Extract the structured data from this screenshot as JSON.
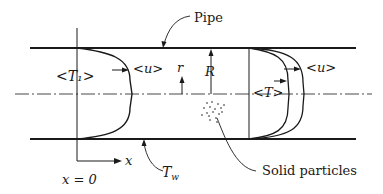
{
  "diagram": {
    "type": "pipe-flow-schematic",
    "labels": {
      "pipe": "Pipe",
      "inlet_temp": "<T₁>",
      "velocity_left": "<u>",
      "velocity_right": "<u>",
      "radial_coord": "r",
      "radius": "R",
      "mean_temp": "<T>",
      "wall_temp": "T",
      "wall_temp_sub": "w",
      "axial_coord": "x",
      "origin": "x = 0",
      "particles": "Solid particles"
    },
    "colors": {
      "line": "#1a1a1a",
      "background": "#ffffff"
    }
  }
}
